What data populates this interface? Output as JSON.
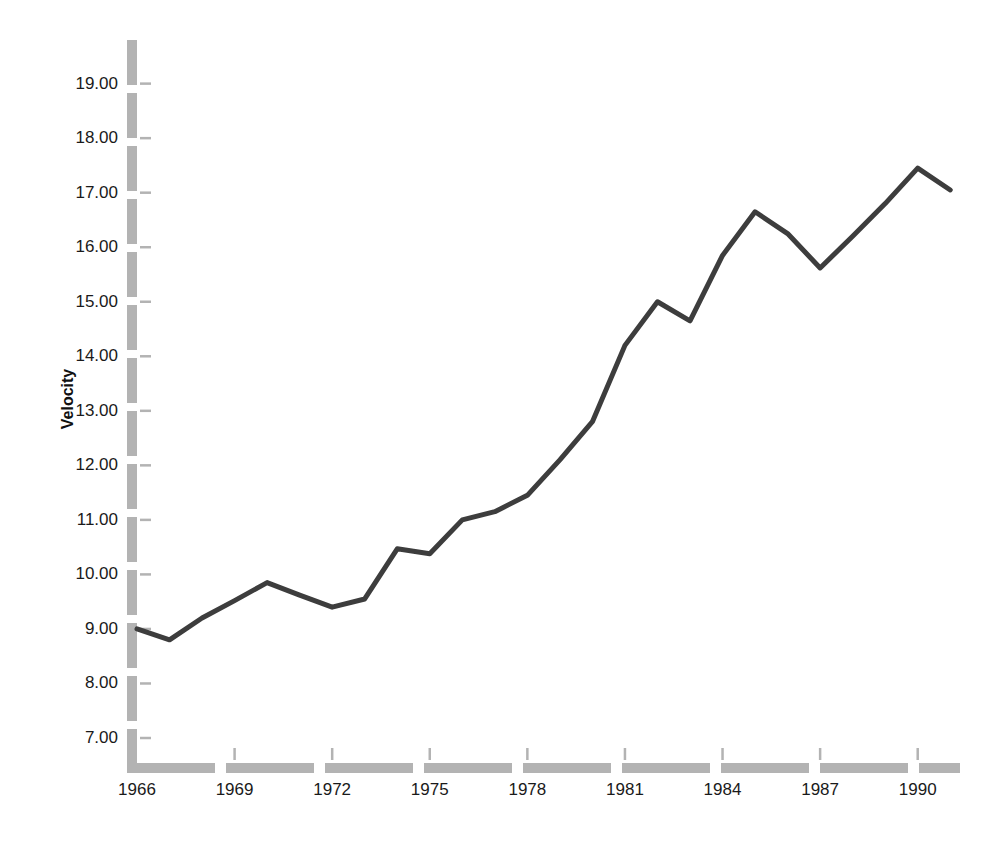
{
  "chart_data": {
    "type": "line",
    "title": "",
    "xlabel": "",
    "ylabel": "Velocity",
    "x": [
      1966,
      1967,
      1968,
      1969,
      1970,
      1971,
      1972,
      1973,
      1974,
      1975,
      1976,
      1977,
      1978,
      1979,
      1980,
      1981,
      1982,
      1983,
      1984,
      1985,
      1986,
      1987,
      1988,
      1989,
      1990,
      1991
    ],
    "values": [
      9.0,
      8.8,
      9.2,
      9.52,
      9.85,
      9.62,
      9.4,
      9.55,
      10.47,
      10.38,
      11.0,
      11.15,
      11.45,
      12.1,
      12.8,
      14.2,
      15.0,
      14.65,
      15.85,
      16.65,
      16.25,
      15.62,
      16.2,
      16.8,
      17.45,
      17.05
    ],
    "series": [
      {
        "name": "Velocity",
        "values": [
          9.0,
          8.8,
          9.2,
          9.52,
          9.85,
          9.62,
          9.4,
          9.55,
          10.47,
          10.38,
          11.0,
          11.15,
          11.45,
          12.1,
          12.8,
          14.2,
          15.0,
          14.65,
          15.85,
          16.65,
          16.25,
          15.62,
          16.2,
          16.8,
          17.45,
          17.05
        ],
        "color": "#3d3d3d"
      }
    ],
    "ylim": [
      6.45,
      19.8
    ],
    "xlim": [
      1966,
      1991.3
    ],
    "yticks": [
      7.0,
      8.0,
      9.0,
      10.0,
      11.0,
      12.0,
      13.0,
      14.0,
      15.0,
      16.0,
      17.0,
      18.0,
      19.0
    ],
    "ytick_labels": [
      "7.00",
      "8.00",
      "9.00",
      "10.00",
      "11.00",
      "12.00",
      "13.00",
      "14.00",
      "15.00",
      "16.00",
      "17.00",
      "18.00",
      "19.00"
    ],
    "xticks": [
      1966,
      1969,
      1972,
      1975,
      1978,
      1981,
      1984,
      1987,
      1990
    ],
    "xtick_labels": [
      "1966",
      "1969",
      "1972",
      "1975",
      "1978",
      "1981",
      "1984",
      "1987",
      "1990"
    ],
    "grid": false,
    "legend": false,
    "legend_position": "none",
    "axis_style": "dashed-bar",
    "colors": {
      "line": "#3d3d3d",
      "axis": "#b3b3b3",
      "tick_mark": "#b3b3b3",
      "text": "#1a1a1a",
      "background": "#ffffff"
    },
    "line_width": 5
  }
}
